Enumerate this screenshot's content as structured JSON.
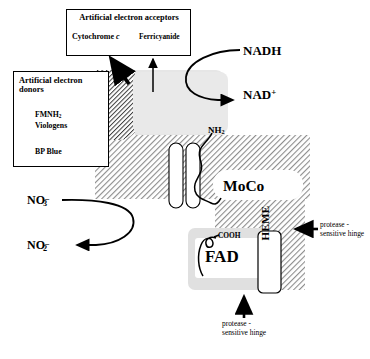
{
  "figure": {
    "width": 370,
    "height": 359,
    "background_color": "#ffffff"
  },
  "boxes": {
    "acceptors": {
      "title": "Artificial electron acceptors",
      "items": [
        {
          "name": "Cytochrome",
          "italic_suffix": "c"
        },
        {
          "name": "Ferricyanide"
        }
      ]
    },
    "donors": {
      "title": "Artificial electron donors",
      "items": [
        {
          "name": "FMNH",
          "subscript": "2"
        },
        {
          "name": "Viologens"
        },
        {
          "name": "BP Blue"
        }
      ]
    }
  },
  "labels": {
    "nadh": "NADH",
    "nad_plus_base": "NAD",
    "nad_plus_sup": "+",
    "nh2_base": "NH",
    "nh2_sub": "2",
    "cooh": "COOH",
    "moco": "MoCo",
    "fad": "FAD",
    "heme": "HEME",
    "no3_base": "NO",
    "no3_sub": "3",
    "no3_sup": "–",
    "no2_base": "NO",
    "no2_sub": "2",
    "no2_sup": "–",
    "hinge_right": "protease - sensitive hinge",
    "hinge_bottom": "protease - sensitive hinge"
  },
  "colors": {
    "line": "#000000",
    "hatch_dark": "#4a4a4a",
    "hatch_light": "#8d8d8d",
    "body_fill": "#d9d9d9",
    "shadow_gray": "#e3e3e3",
    "white": "#ffffff"
  },
  "arrows": [
    {
      "name": "cytochrome-c-arrow",
      "kind": "thick-diagonal",
      "to": "Cytochrome c"
    },
    {
      "name": "ferricyanide-arrow",
      "kind": "thin-vertical",
      "to": "Ferricyanide"
    },
    {
      "name": "fmnh2-arrow",
      "kind": "thick-horizontal",
      "to": "membrane"
    },
    {
      "name": "viologens-arrow",
      "kind": "thick-horizontal",
      "to": "membrane"
    },
    {
      "name": "bp-blue-arrow",
      "kind": "thin-horizontal",
      "to": "membrane"
    },
    {
      "name": "nadh-to-nad-arrow",
      "kind": "curved",
      "from": "NADH",
      "to": "NAD +"
    },
    {
      "name": "no3-to-no2-arrow",
      "kind": "curved",
      "from": "NO3-",
      "to": "NO2-"
    },
    {
      "name": "hinge-right-arrow",
      "kind": "thick-horizontal-left",
      "to": "hinge"
    },
    {
      "name": "hinge-bottom-arrow",
      "kind": "thick-vertical-up",
      "to": "hinge"
    }
  ]
}
